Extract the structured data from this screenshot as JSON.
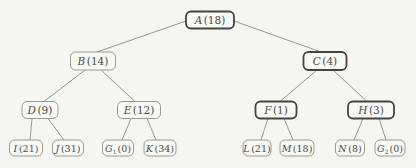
{
  "figure": {
    "kind": "binary-tree-diagram"
  },
  "colors": {
    "background": "#f5f5f1",
    "edge": "#8d8d85",
    "border_normal": "#9b9b92",
    "border_emphasis": "#45453f",
    "text": "#4c4c46"
  },
  "tree": {
    "root": "A",
    "nodes": [
      {
        "id": "A",
        "letter": "A",
        "paren": "(18)",
        "bold": true,
        "children": [
          "B",
          "C"
        ]
      },
      {
        "id": "B",
        "letter": "B",
        "paren": "(14)",
        "bold": false,
        "children": [
          "D",
          "E"
        ]
      },
      {
        "id": "C",
        "letter": "C",
        "paren": "(4)",
        "bold": true,
        "children": [
          "F",
          "H"
        ]
      },
      {
        "id": "D",
        "letter": "D",
        "paren": "(9)",
        "bold": false,
        "children": [
          "I",
          "J"
        ]
      },
      {
        "id": "E",
        "letter": "E",
        "paren": "(12)",
        "bold": false,
        "children": [
          "G1",
          "K"
        ]
      },
      {
        "id": "F",
        "letter": "F",
        "paren": "(1)",
        "bold": true,
        "children": [
          "L",
          "M"
        ]
      },
      {
        "id": "H",
        "letter": "H",
        "paren": "(3)",
        "bold": true,
        "children": [
          "N",
          "G2"
        ]
      },
      {
        "id": "I",
        "letter": "I",
        "paren": "(21)",
        "bold": false,
        "children": []
      },
      {
        "id": "J",
        "letter": "J",
        "paren": "(31)",
        "bold": false,
        "children": []
      },
      {
        "id": "G1",
        "letter": "G",
        "sub": "1",
        "paren": "(0)",
        "bold": false,
        "children": []
      },
      {
        "id": "K",
        "letter": "K",
        "paren": "(34)",
        "bold": false,
        "children": []
      },
      {
        "id": "L",
        "letter": "L",
        "paren": "(21)",
        "bold": false,
        "children": []
      },
      {
        "id": "M",
        "letter": "M",
        "paren": "(18)",
        "bold": false,
        "children": []
      },
      {
        "id": "N",
        "letter": "N",
        "paren": "(8)",
        "bold": false,
        "children": []
      },
      {
        "id": "G2",
        "letter": "G",
        "sub": "2",
        "paren": "(0)",
        "bold": false,
        "children": []
      }
    ]
  }
}
